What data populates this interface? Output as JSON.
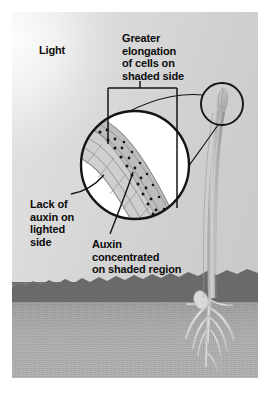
{
  "figure": {
    "type": "biology-diagram"
  },
  "labels": {
    "light": "Light",
    "greater_elongation": "Greater\nelongation\nof cells on\nshaded side",
    "lack_of_auxin": "Lack of\nauxin on\nlighted\nside",
    "auxin_concentrated": "Auxin\nconcentrated\non shaded region"
  },
  "scene": {
    "background_light_color": "#e3e3e3",
    "background_shade_color": "#c9c9c9",
    "soil_top_color": "#6f6f6f",
    "soil_bottom_color": "#b3b3b3",
    "line_color": "#111111",
    "plant_color": "#b9b9b9",
    "auxin_dot_color": "#141414"
  },
  "parts": {
    "magnifier_circle": "large-detail-circle",
    "source_circle": "coleoptile-tip-circle",
    "bracket": "elongation-bracket",
    "seedling": "curved-seedling",
    "roots": "root-system",
    "seed": "seed-kernel",
    "soil": "soil-layer",
    "coleoptile_tip": "magnified-coleoptile-tip",
    "auxin_dots": "auxin-granules"
  }
}
